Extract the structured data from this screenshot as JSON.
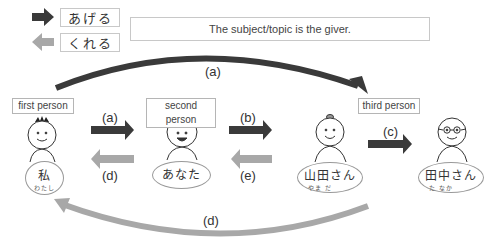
{
  "legend": {
    "ageru": {
      "label": "あげる",
      "arrow_color": "#3a3a3a",
      "icon": "dark-arrow-right-icon"
    },
    "kureru": {
      "label": "くれる",
      "arrow_color": "#a8a8a8",
      "icon": "gray-arrow-left-icon"
    }
  },
  "topic_note": "The subject/topic is the giver.",
  "colors": {
    "dark_arrow": "#3a3a3a",
    "light_arrow": "#a8a8a8",
    "border": "#c8c8c8",
    "hair_second": "#c8c8c8"
  },
  "people": {
    "first": {
      "role_label": "first person",
      "name": "私",
      "ruby": "わたし"
    },
    "second": {
      "role_label": "second person",
      "name": "あなた",
      "ruby": ""
    },
    "third_a": {
      "role_label": "third person",
      "name": "山田さん",
      "ruby": "やま だ"
    },
    "third_b": {
      "role_label": "",
      "name": "田中さん",
      "ruby": "た なか"
    }
  },
  "arrows": {
    "top_arc": {
      "label": "(a)",
      "from": "first person",
      "to": "third person",
      "type": "あげる"
    },
    "first_to_second": {
      "label": "(a)",
      "type": "あげる"
    },
    "second_to_first": {
      "label": "(d)",
      "type": "くれる"
    },
    "second_to_third": {
      "label": "(b)",
      "type": "あげる"
    },
    "third_to_second": {
      "label": "(e)",
      "type": "くれる"
    },
    "third_to_third": {
      "label": "(c)",
      "type": "あげる"
    },
    "bottom_arc": {
      "label": "(d)",
      "from": "third person",
      "to": "first person",
      "type": "くれる"
    }
  }
}
